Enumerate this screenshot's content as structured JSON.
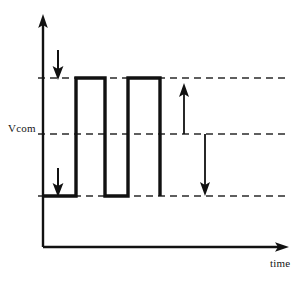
{
  "figure": {
    "title": "",
    "type": "waveform-timing-diagram",
    "background_color": "#ffffff",
    "line_color": "#111111",
    "dashed_color": "#2a2a2a"
  },
  "axes": {
    "y_axis": {
      "name": "voltage-axis",
      "label": "",
      "arrow": "up",
      "x": 43,
      "y_top": 18,
      "y_bottom": 247
    },
    "x_axis": {
      "name": "time-axis",
      "label": "time",
      "arrow": "right",
      "y": 247,
      "x_left": 43,
      "x_right": 287
    }
  },
  "labels": {
    "vcom": "Vcom",
    "time": "time"
  },
  "levels": {
    "high": {
      "name": "high-level",
      "y": 78,
      "label": ""
    },
    "vcom": {
      "name": "vcom-level",
      "y": 134,
      "label": "Vcom"
    },
    "low": {
      "name": "low-level",
      "y": 196,
      "label": ""
    },
    "dash_x_start": 38,
    "dash_x_end": 285
  },
  "chart_data": {
    "type": "line",
    "title": "",
    "xlabel": "time",
    "ylabel": "",
    "grid": false,
    "legend": null,
    "annotations": [
      {
        "name": "vcom-label",
        "text": "Vcom",
        "x": 8,
        "y": 128
      },
      {
        "name": "time-label",
        "text": "time",
        "x": 270,
        "y": 262
      }
    ],
    "reference_lines": [
      {
        "name": "high-reference-line",
        "y_level": "high",
        "y": 78,
        "style": "dashed"
      },
      {
        "name": "vcom-reference-line",
        "y_level": "vcom",
        "y": 134,
        "style": "dashed"
      },
      {
        "name": "low-reference-line",
        "y_level": "low",
        "y": 196,
        "style": "dashed"
      }
    ],
    "series": [
      {
        "name": "pixel-voltage-waveform",
        "points": [
          [
            43,
            196
          ],
          [
            76,
            196
          ],
          [
            76,
            78
          ],
          [
            105,
            78
          ],
          [
            105,
            196
          ],
          [
            128,
            196
          ],
          [
            128,
            78
          ],
          [
            160,
            78
          ],
          [
            160,
            196
          ]
        ]
      }
    ],
    "markers": [
      {
        "name": "down-arrow-top",
        "type": "arrow",
        "direction": "down",
        "x": 58,
        "y_from": 50,
        "y_to": 79
      },
      {
        "name": "down-arrow-bottom",
        "type": "arrow",
        "direction": "down",
        "x": 58,
        "y_from": 168,
        "y_to": 196
      },
      {
        "name": "up-arrow-vcom-to-high",
        "type": "arrow",
        "direction": "up",
        "x": 184,
        "y_from": 134,
        "y_to": 82
      },
      {
        "name": "down-arrow-vcom-to-low",
        "type": "arrow",
        "direction": "down",
        "x": 205,
        "y_from": 134,
        "y_to": 196
      }
    ]
  }
}
